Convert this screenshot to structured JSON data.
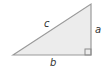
{
  "diagram": {
    "type": "right-triangle",
    "fill_color": "#ececec",
    "stroke_color": "#9a9a9a",
    "labels": {
      "hypotenuse": "c",
      "vertical_leg": "a",
      "horizontal_leg": "b"
    },
    "right_angle_marker": true
  }
}
